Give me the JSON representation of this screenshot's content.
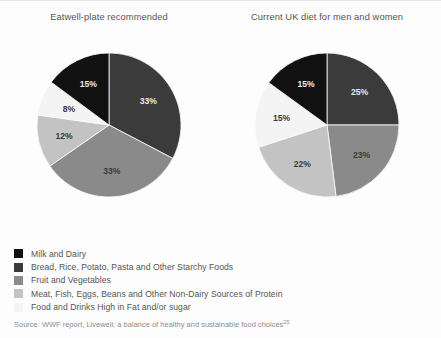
{
  "figure": {
    "background_color": "#fdfdfd",
    "border_color": "#e6e6e6"
  },
  "categories": [
    {
      "key": "milk_dairy",
      "label": "Milk and Dairy",
      "color": "#111111"
    },
    {
      "key": "starchy",
      "label": "Bread, Rice, Potato, Pasta and Other Starchy Foods",
      "color": "#3b3b3b"
    },
    {
      "key": "fruit_veg",
      "label": "Fruit and Vegetables",
      "color": "#8a8a8a"
    },
    {
      "key": "protein",
      "label": "Meat, Fish, Eggs, Beans and Other Non-Dairy Sources of Protein",
      "color": "#c3c3c3"
    },
    {
      "key": "fat_sugar",
      "label": "Food and Drinks High in Fat and/or sugar",
      "color": "#f4f4f4"
    }
  ],
  "source": {
    "text": "Source: WWF report, Livewell: a balance of healthy and sustainable food choices",
    "reference": "25"
  },
  "chart_data": [
    {
      "type": "pie",
      "title": "Eatwell-plate recommended",
      "categories": [
        "Bread, Rice, Potato, Pasta and Other Starchy Foods",
        "Fruit and Vegetables",
        "Meat, Fish, Eggs, Beans and Other Non-Dairy Sources of Protein",
        "Food and Drinks High in Fat and/or sugar",
        "Milk and Dairy"
      ],
      "values": [
        33,
        33,
        12,
        8,
        15
      ],
      "labels": [
        "33%",
        "33%",
        "12%",
        "8%",
        "15%"
      ],
      "colors": [
        "#3b3b3b",
        "#8a8a8a",
        "#c3c3c3",
        "#f4f4f4",
        "#111111"
      ],
      "label_contrast": [
        "on-dark",
        "on-light",
        "on-light",
        "on-light",
        "on-dark"
      ],
      "start_angle_deg": 0,
      "direction": "clockwise",
      "unit": "%",
      "legend_position": "bottom"
    },
    {
      "type": "pie",
      "title": "Current UK diet for men and women",
      "categories": [
        "Bread, Rice, Potato, Pasta and Other Starchy Foods",
        "Fruit and Vegetables",
        "Meat, Fish, Eggs, Beans and Other Non-Dairy Sources of Protein",
        "Food and Drinks High in Fat and/or sugar",
        "Milk and Dairy"
      ],
      "values": [
        25,
        23,
        22,
        15,
        15
      ],
      "labels": [
        "25%",
        "23%",
        "22%",
        "15%",
        "15%"
      ],
      "colors": [
        "#3b3b3b",
        "#8a8a8a",
        "#c3c3c3",
        "#f4f4f4",
        "#111111"
      ],
      "label_contrast": [
        "on-dark",
        "on-light",
        "on-light",
        "on-light",
        "on-dark"
      ],
      "start_angle_deg": 0,
      "direction": "clockwise",
      "unit": "%",
      "legend_position": "bottom"
    }
  ]
}
